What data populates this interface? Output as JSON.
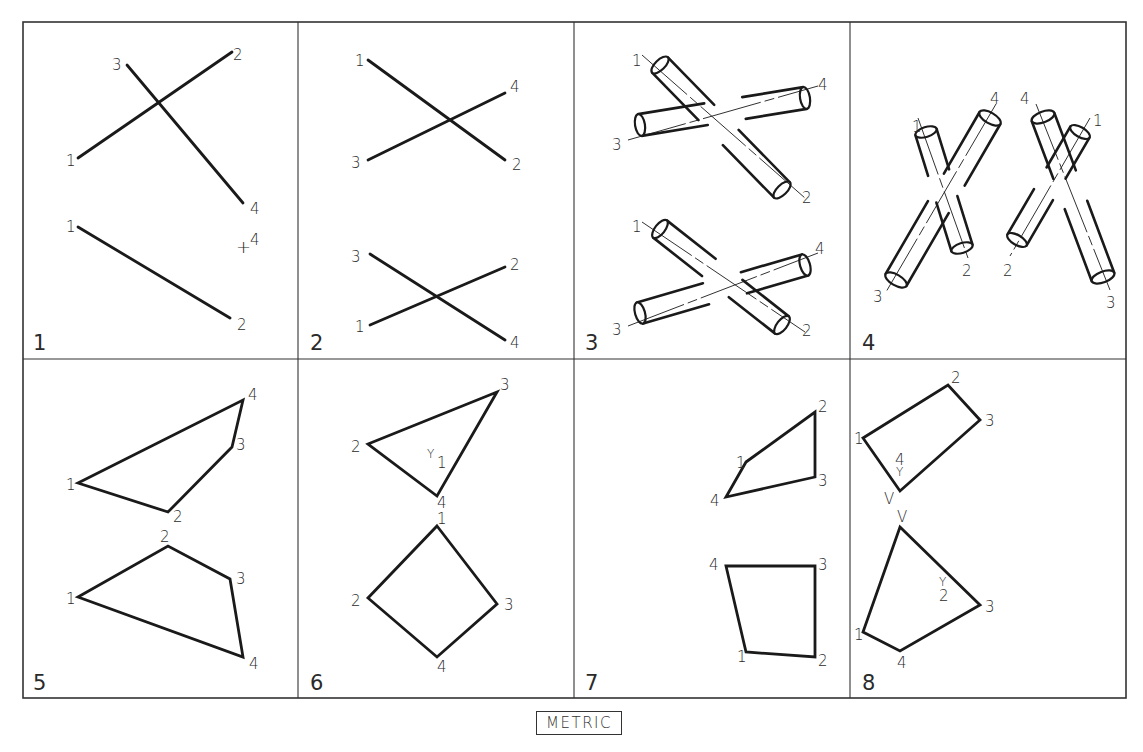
{
  "title_box": "METRIC",
  "colors": {
    "ink": "#1a1a1a",
    "border": "#333333",
    "background": "#ffffff"
  },
  "grid": {
    "outer": {
      "x1": 23,
      "y1": 22,
      "x2": 1126,
      "y2": 698
    },
    "vertical_dividers": [
      298,
      574,
      850
    ],
    "horizontal_divider": 359
  },
  "panels": [
    {
      "number": "1",
      "number_pos": [
        33,
        350
      ],
      "lines": [
        {
          "p": [
            [
              78,
              158
            ],
            [
              232,
              52
            ]
          ],
          "w": 2.8
        },
        {
          "p": [
            [
              127,
              65
            ],
            [
              243,
              203
            ]
          ],
          "w": 2.8
        },
        {
          "p": [
            [
              78,
              227
            ],
            [
              230,
              318
            ]
          ],
          "w": 2.8
        }
      ],
      "labels": [
        {
          "t": "2",
          "x": 233,
          "y": 60
        },
        {
          "t": "3",
          "x": 112,
          "y": 70
        },
        {
          "t": "1",
          "x": 66,
          "y": 166
        },
        {
          "t": "4",
          "x": 250,
          "y": 214
        },
        {
          "t": "1",
          "x": 66,
          "y": 232
        },
        {
          "t": "+",
          "x": 236,
          "y": 253,
          "size": 18
        },
        {
          "t": "4",
          "x": 250,
          "y": 245
        },
        {
          "t": "2",
          "x": 237,
          "y": 330
        }
      ]
    },
    {
      "number": "2",
      "number_pos": [
        310,
        350
      ],
      "lines": [
        {
          "p": [
            [
              368,
              60
            ],
            [
              505,
              160
            ]
          ],
          "w": 2.8
        },
        {
          "p": [
            [
              368,
              160
            ],
            [
              505,
              93
            ]
          ],
          "w": 2.8
        },
        {
          "p": [
            [
              370,
              254
            ],
            [
              505,
              340
            ]
          ],
          "w": 2.8
        },
        {
          "p": [
            [
              370,
              325
            ],
            [
              505,
              267
            ]
          ],
          "w": 2.8
        }
      ],
      "labels": [
        {
          "t": "1",
          "x": 355,
          "y": 66
        },
        {
          "t": "4",
          "x": 510,
          "y": 92
        },
        {
          "t": "3",
          "x": 351,
          "y": 168
        },
        {
          "t": "2",
          "x": 512,
          "y": 170
        },
        {
          "t": "3",
          "x": 351,
          "y": 262
        },
        {
          "t": "2",
          "x": 510,
          "y": 270
        },
        {
          "t": "1",
          "x": 355,
          "y": 332
        },
        {
          "t": "4",
          "x": 510,
          "y": 348
        }
      ]
    },
    {
      "number": "3",
      "number_pos": [
        585,
        350
      ],
      "tubes": [
        {
          "cx1": 660,
          "cy1": 65,
          "cx2": 782,
          "cy2": 190,
          "r": 11,
          "gap": [
            0.38,
            0.58
          ]
        },
        {
          "cx1": 640,
          "cy1": 125,
          "cx2": 805,
          "cy2": 98,
          "r": 11,
          "gap": [
            0.4,
            0.63
          ]
        },
        {
          "cx1": 660,
          "cy1": 229,
          "cx2": 782,
          "cy2": 325,
          "r": 11,
          "gap": [
            0.4,
            0.62
          ]
        },
        {
          "cx1": 640,
          "cy1": 313,
          "cx2": 805,
          "cy2": 265,
          "r": 11,
          "gap": [
            0.4,
            0.63
          ]
        }
      ],
      "axes": [
        {
          "p": [
            [
              642,
              55
            ],
            [
              805,
              198
            ]
          ]
        },
        {
          "p": [
            [
              628,
              140
            ],
            [
              818,
              86
            ]
          ]
        },
        {
          "p": [
            [
              642,
              222
            ],
            [
              805,
              332
            ]
          ]
        },
        {
          "p": [
            [
              628,
              326
            ],
            [
              818,
              253
            ]
          ]
        }
      ],
      "labels": [
        {
          "t": "1",
          "x": 632,
          "y": 66
        },
        {
          "t": "4",
          "x": 818,
          "y": 90
        },
        {
          "t": "3",
          "x": 612,
          "y": 150
        },
        {
          "t": "2",
          "x": 802,
          "y": 203
        },
        {
          "t": "1",
          "x": 632,
          "y": 232
        },
        {
          "t": "4",
          "x": 815,
          "y": 254
        },
        {
          "t": "3",
          "x": 612,
          "y": 335
        },
        {
          "t": "2",
          "x": 802,
          "y": 336
        }
      ]
    },
    {
      "number": "4",
      "number_pos": [
        862,
        350
      ],
      "tubes": [
        {
          "cx1": 926,
          "cy1": 132,
          "cx2": 962,
          "cy2": 248,
          "r": 11,
          "gap": [
            0.35,
            0.58
          ]
        },
        {
          "cx1": 990,
          "cy1": 118,
          "cx2": 896,
          "cy2": 280,
          "r": 12,
          "gap": [
            0.38,
            0.55
          ]
        },
        {
          "cx1": 1043,
          "cy1": 117,
          "cx2": 1103,
          "cy2": 277,
          "r": 12,
          "gap": [
            0.36,
            0.55
          ]
        },
        {
          "cx1": 1080,
          "cy1": 132,
          "cx2": 1017,
          "cy2": 240,
          "r": 11,
          "gap": [
            0.38,
            0.58
          ]
        }
      ],
      "axes": [
        {
          "p": [
            [
              918,
              118
            ],
            [
              968,
              258
            ]
          ]
        },
        {
          "p": [
            [
              996,
              104
            ],
            [
              886,
              292
            ]
          ]
        },
        {
          "p": [
            [
              1036,
              104
            ],
            [
              1110,
              290
            ]
          ]
        },
        {
          "p": [
            [
              1090,
              118
            ],
            [
              1010,
              256
            ]
          ]
        }
      ],
      "labels": [
        {
          "t": "1",
          "x": 912,
          "y": 132
        },
        {
          "t": "4",
          "x": 990,
          "y": 104
        },
        {
          "t": "2",
          "x": 962,
          "y": 276
        },
        {
          "t": "3",
          "x": 873,
          "y": 302
        },
        {
          "t": "4",
          "x": 1020,
          "y": 104
        },
        {
          "t": "1",
          "x": 1093,
          "y": 126
        },
        {
          "t": "2",
          "x": 1003,
          "y": 276
        },
        {
          "t": "3",
          "x": 1106,
          "y": 308
        }
      ]
    },
    {
      "number": "5",
      "number_pos": [
        33,
        690
      ],
      "polygons": [
        {
          "p": [
            [
              78,
              483
            ],
            [
              243,
              400
            ],
            [
              232,
              447
            ],
            [
              168,
              512
            ]
          ],
          "w": 2.8
        },
        {
          "p": [
            [
              78,
              597
            ],
            [
              168,
              546
            ],
            [
              230,
              579
            ],
            [
              243,
              657
            ]
          ],
          "w": 2.8
        }
      ],
      "labels": [
        {
          "t": "4",
          "x": 248,
          "y": 400
        },
        {
          "t": "3",
          "x": 236,
          "y": 450
        },
        {
          "t": "1",
          "x": 66,
          "y": 490
        },
        {
          "t": "2",
          "x": 173,
          "y": 522
        },
        {
          "t": "2",
          "x": 160,
          "y": 542
        },
        {
          "t": "3",
          "x": 236,
          "y": 584
        },
        {
          "t": "1",
          "x": 66,
          "y": 604
        },
        {
          "t": "4",
          "x": 249,
          "y": 669
        }
      ]
    },
    {
      "number": "6",
      "number_pos": [
        310,
        690
      ],
      "polygons": [
        {
          "p": [
            [
              368,
              444
            ],
            [
              497,
              392
            ],
            [
              437,
              496
            ]
          ],
          "w": 2.8
        },
        {
          "p": [
            [
              437,
              526
            ],
            [
              497,
              604
            ],
            [
              437,
              657
            ],
            [
              368,
              598
            ]
          ],
          "w": 2.8
        }
      ],
      "labels": [
        {
          "t": "3",
          "x": 500,
          "y": 390
        },
        {
          "t": "2",
          "x": 351,
          "y": 452
        },
        {
          "t": "Y",
          "x": 427,
          "y": 458,
          "size": 12
        },
        {
          "t": "1",
          "x": 437,
          "y": 468
        },
        {
          "t": "4",
          "x": 437,
          "y": 508
        },
        {
          "t": "1",
          "x": 437,
          "y": 524
        },
        {
          "t": "2",
          "x": 351,
          "y": 606
        },
        {
          "t": "3",
          "x": 504,
          "y": 610
        },
        {
          "t": "4",
          "x": 437,
          "y": 672
        }
      ]
    },
    {
      "number": "7",
      "number_pos": [
        585,
        690
      ],
      "polygons": [
        {
          "p": [
            [
              746,
              462
            ],
            [
              815,
              412
            ],
            [
              815,
              477
            ],
            [
              726,
              497
            ]
          ],
          "w": 2.8
        },
        {
          "p": [
            [
              726,
              566
            ],
            [
              815,
              566
            ],
            [
              815,
              657
            ],
            [
              746,
              652
            ]
          ],
          "w": 2.8
        }
      ],
      "labels": [
        {
          "t": "2",
          "x": 818,
          "y": 412
        },
        {
          "t": "1",
          "x": 736,
          "y": 468
        },
        {
          "t": "3",
          "x": 818,
          "y": 486
        },
        {
          "t": "4",
          "x": 710,
          "y": 506
        },
        {
          "t": "4",
          "x": 709,
          "y": 570
        },
        {
          "t": "3",
          "x": 818,
          "y": 570
        },
        {
          "t": "1",
          "x": 737,
          "y": 662
        },
        {
          "t": "2",
          "x": 818,
          "y": 666
        }
      ]
    },
    {
      "number": "8",
      "number_pos": [
        862,
        690
      ],
      "polygons": [
        {
          "p": [
            [
              863,
              438
            ],
            [
              948,
              385
            ],
            [
              980,
              420
            ],
            [
              900,
              491
            ]
          ],
          "w": 2.8
        },
        {
          "p": [
            [
              900,
              527
            ],
            [
              980,
              605
            ],
            [
              900,
              651
            ],
            [
              863,
              632
            ]
          ],
          "w": 2.8
        }
      ],
      "labels": [
        {
          "t": "2",
          "x": 951,
          "y": 383
        },
        {
          "t": "3",
          "x": 985,
          "y": 426
        },
        {
          "t": "1",
          "x": 854,
          "y": 444
        },
        {
          "t": "4",
          "x": 895,
          "y": 465
        },
        {
          "t": "Y",
          "x": 896,
          "y": 476,
          "size": 12
        },
        {
          "t": "V",
          "x": 884,
          "y": 504
        },
        {
          "t": "V",
          "x": 897,
          "y": 522
        },
        {
          "t": "Y",
          "x": 939,
          "y": 586,
          "size": 12
        },
        {
          "t": "2",
          "x": 939,
          "y": 601
        },
        {
          "t": "3",
          "x": 985,
          "y": 612
        },
        {
          "t": "1",
          "x": 854,
          "y": 640
        },
        {
          "t": "4",
          "x": 897,
          "y": 668
        }
      ]
    }
  ]
}
